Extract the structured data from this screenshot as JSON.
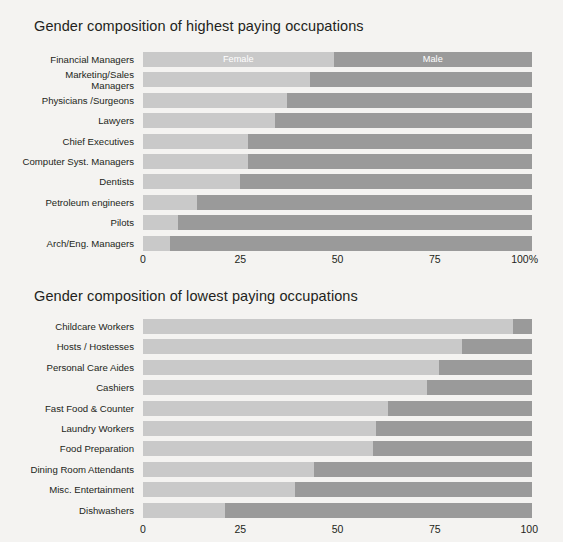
{
  "chart_data": [
    {
      "type": "bar",
      "orientation": "horizontal",
      "stacked": true,
      "normalized": true,
      "title": "Gender composition of highest paying occupations",
      "xlabel": "",
      "ylabel": "",
      "xlim": [
        0,
        100
      ],
      "grid": false,
      "legend": {
        "position": "inside-first-bar",
        "entries": [
          "Female",
          "Male"
        ]
      },
      "ticks": [
        "0",
        "25",
        "50",
        "75",
        "100%"
      ],
      "tick_values": [
        0,
        25,
        50,
        75,
        100
      ],
      "categories": [
        "Financial Managers",
        "Marketing/Sales\nManagers",
        "Physicians /Surgeons",
        "Lawyers",
        "Chief Executives",
        "Computer Syst. Managers",
        "Dentists",
        "Petroleum engineers",
        "Pilots",
        "Arch/Eng. Managers"
      ],
      "series": [
        {
          "name": "Female",
          "color": "#c9c9c9",
          "values": [
            49,
            43,
            37,
            34,
            27,
            27,
            25,
            14,
            9,
            7
          ]
        },
        {
          "name": "Male",
          "color": "#9a9a9a",
          "values": [
            51,
            57,
            63,
            66,
            73,
            73,
            75,
            86,
            91,
            93
          ]
        }
      ]
    },
    {
      "type": "bar",
      "orientation": "horizontal",
      "stacked": true,
      "normalized": true,
      "title": "Gender composition of lowest paying occupations",
      "xlabel": "",
      "ylabel": "",
      "xlim": [
        0,
        100
      ],
      "grid": false,
      "legend": {
        "position": "none",
        "entries": [
          "Female",
          "Male"
        ]
      },
      "ticks": [
        "0",
        "25",
        "50",
        "75",
        "100"
      ],
      "tick_values": [
        0,
        25,
        50,
        75,
        100
      ],
      "categories": [
        "Childcare Workers",
        "Hosts / Hostesses",
        "Personal Care Aides",
        "Cashiers",
        "Fast Food & Counter",
        "Laundry Workers",
        "Food Preparation",
        "Dining Room Attendants",
        "Misc. Entertainment",
        "Dishwashers"
      ],
      "series": [
        {
          "name": "Female",
          "color": "#c9c9c9",
          "values": [
            95,
            82,
            76,
            73,
            63,
            60,
            59,
            44,
            39,
            21
          ]
        },
        {
          "name": "Male",
          "color": "#9a9a9a",
          "values": [
            5,
            18,
            24,
            27,
            37,
            40,
            41,
            56,
            61,
            79
          ]
        }
      ]
    }
  ],
  "colors": {
    "background": "#f4f3f1",
    "female_bar": "#c9c9c9",
    "male_bar": "#9a9a9a",
    "text": "#231f20",
    "legend_text": "#ffffff"
  }
}
